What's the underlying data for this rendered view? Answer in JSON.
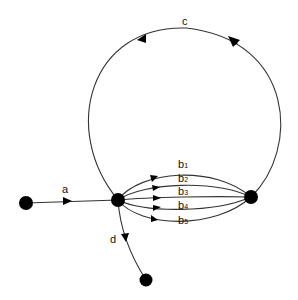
{
  "diagram": {
    "type": "directed multigraph",
    "nodes": [
      {
        "id": "source",
        "x": 26,
        "y": 203
      },
      {
        "id": "hub",
        "x": 118,
        "y": 200
      },
      {
        "id": "right",
        "x": 251,
        "y": 197
      },
      {
        "id": "sink",
        "x": 146,
        "y": 280
      }
    ],
    "edges": [
      {
        "id": "a",
        "label": "a",
        "from": "source",
        "to": "hub"
      },
      {
        "id": "b1",
        "label": "b",
        "subscript": "1",
        "from": "hub",
        "to": "right"
      },
      {
        "id": "b2",
        "label": "b",
        "subscript": "2",
        "from": "hub",
        "to": "right"
      },
      {
        "id": "b3",
        "label": "b",
        "subscript": "3",
        "from": "hub",
        "to": "right"
      },
      {
        "id": "b4",
        "label": "b",
        "subscript": "4",
        "from": "hub",
        "to": "right"
      },
      {
        "id": "b5",
        "label": "b",
        "subscript": "5",
        "from": "hub",
        "to": "right"
      },
      {
        "id": "c",
        "label": "c",
        "from": "right",
        "to": "hub"
      },
      {
        "id": "d",
        "label": "d",
        "from": "hub",
        "to": "sink"
      }
    ]
  },
  "labels": {
    "a": "a",
    "b": "b",
    "b1_sub": "1",
    "b2_sub": "2",
    "b3_sub": "3",
    "b4_sub": "4",
    "b5_sub": "5",
    "c": "c",
    "d": "d"
  },
  "colors": {
    "stroke": "#333333",
    "node": "#000000",
    "background": "#ffffff"
  }
}
